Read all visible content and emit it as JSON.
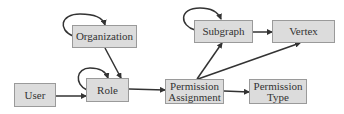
{
  "diagram": {
    "nodes": {
      "user": {
        "label": "User"
      },
      "organization": {
        "label": "Organization"
      },
      "role": {
        "label": "Role"
      },
      "permission_assignment": {
        "line1": "Permission",
        "line2": "Assignment"
      },
      "permission_type": {
        "line1": "Permission",
        "line2": "Type"
      },
      "subgraph": {
        "label": "Subgraph"
      },
      "vertex": {
        "label": "Vertex"
      }
    },
    "edges": [
      {
        "from": "Organization",
        "to": "Organization",
        "kind": "self-loop"
      },
      {
        "from": "Organization",
        "to": "Role"
      },
      {
        "from": "Role",
        "to": "Role",
        "kind": "self-loop"
      },
      {
        "from": "User",
        "to": "Role"
      },
      {
        "from": "Role",
        "to": "Permission Assignment"
      },
      {
        "from": "Permission Assignment",
        "to": "Permission Type"
      },
      {
        "from": "Permission Assignment",
        "to": "Subgraph"
      },
      {
        "from": "Permission Assignment",
        "to": "Vertex"
      },
      {
        "from": "Subgraph",
        "to": "Subgraph",
        "kind": "self-loop"
      },
      {
        "from": "Subgraph",
        "to": "Vertex"
      }
    ],
    "colors": {
      "node_fill": "#dcdcdc",
      "node_border": "#9a9a9a",
      "edge": "#333333",
      "text": "#333333"
    }
  }
}
